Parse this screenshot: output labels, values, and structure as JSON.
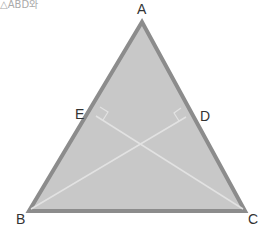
{
  "caption": "△ABD와",
  "diagram": {
    "fill": "#c8c8c8",
    "stroke": "#8c8c8c",
    "inner_line": "#dedede",
    "vertices": {
      "A": {
        "label": "A",
        "x": 142,
        "y": 22
      },
      "B": {
        "label": "B",
        "x": 29,
        "y": 211
      },
      "C": {
        "label": "C",
        "x": 245,
        "y": 211
      },
      "D": {
        "label": "D",
        "x": 187,
        "y": 116
      },
      "E": {
        "label": "E",
        "x": 95,
        "y": 115
      }
    },
    "segments": [
      "AB",
      "AC",
      "BC",
      "BD",
      "CE"
    ],
    "right_angles": [
      "E",
      "D"
    ]
  }
}
